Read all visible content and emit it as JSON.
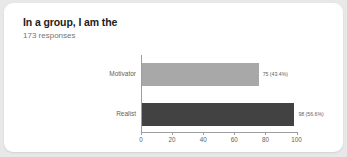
{
  "card": {
    "title": "In a group, I am the",
    "response_count": "173 responses"
  },
  "chart_data": {
    "type": "bar",
    "orientation": "horizontal",
    "title": "In a group, I am the",
    "subtitle": "173 responses",
    "xlabel": "",
    "ylabel": "",
    "xlim": [
      0,
      110
    ],
    "grid": false,
    "legend": false,
    "total_responses": 173,
    "categories": [
      "Motivator",
      "Realist"
    ],
    "values": [
      75,
      98
    ],
    "percents": [
      43.4,
      56.6
    ],
    "data_labels": [
      "75 (43.4%)",
      "98 (56.6%)"
    ],
    "colors": [
      "#a8a8a8",
      "#424242"
    ],
    "xticks": [
      0,
      20,
      40,
      60,
      80,
      100
    ],
    "xtick_labels": [
      "0",
      "20",
      "40",
      "60",
      "80",
      "100"
    ],
    "axis_color": "#9e9e9e",
    "label_color": "#5f5f5f",
    "title_color": "#212121",
    "subtitle_color": "#757575",
    "background": "#ffffff",
    "page_background": "#e8e8e8"
  }
}
